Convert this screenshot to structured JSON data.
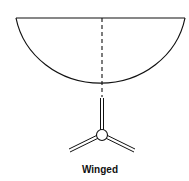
{
  "diagram": {
    "label": "Winged",
    "colors": {
      "stroke": "#111111",
      "background": "#ffffff"
    }
  }
}
